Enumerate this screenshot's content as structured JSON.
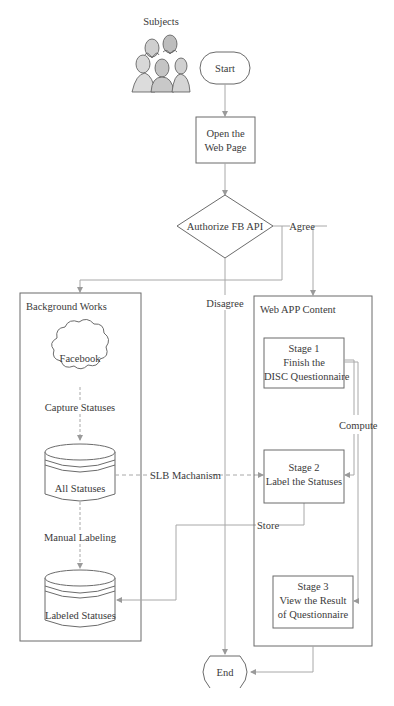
{
  "diagram": {
    "type": "flowchart",
    "colors": {
      "stroke": "#6b6b6b",
      "connector": "#a8a8a8",
      "background": "#ffffff",
      "text": "#333333"
    },
    "actor": {
      "label": "Subjects",
      "icon": "people-group-icon"
    },
    "nodes": {
      "start": {
        "label": "Start",
        "shape": "terminator"
      },
      "open_page": {
        "line1": "Open the",
        "line2": "Web Page",
        "shape": "process"
      },
      "authorize": {
        "label": "Authorize FB API",
        "shape": "decision"
      },
      "end": {
        "label": "End",
        "shape": "terminator"
      }
    },
    "background_works": {
      "title": "Background Works",
      "facebook": {
        "label": "Facebook",
        "shape": "cloud"
      },
      "capture_label": "Capture Statuses",
      "all_statuses": {
        "label": "All Statuses",
        "shape": "database"
      },
      "manual_label": "Manual Labeling",
      "labeled_statuses": {
        "label": "Labeled Statuses",
        "shape": "database"
      }
    },
    "web_app": {
      "title": "Web APP Content",
      "stage1": {
        "line1": "Stage 1",
        "line2": "Finish the",
        "line3": "DISC Questionnaire"
      },
      "stage2": {
        "line1": "Stage 2",
        "line2": "Label the Statuses"
      },
      "stage3": {
        "line1": "Stage 3",
        "line2": "View the Result",
        "line3": "of Questionnaire"
      }
    },
    "edge_labels": {
      "agree": "Agree",
      "disagree": "Disagree",
      "slb": "SLB Machanism",
      "store": "Store",
      "compute": "Compute"
    }
  }
}
